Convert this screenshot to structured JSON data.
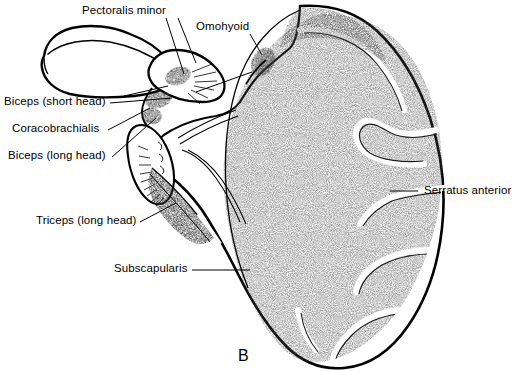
{
  "figure": {
    "letter": "B",
    "view": "anterior-costal-surface-right-scapula",
    "background_color": "#ffffff",
    "ink_color": "#000000",
    "stipple_color": "#5a5a5a"
  },
  "labels": [
    {
      "id": "pectoralis-minor",
      "text": "Pectoralis minor",
      "text_x": 82,
      "text_y": 4,
      "leader": [
        [
          178,
          18
        ],
        [
          196,
          63
        ]
      ]
    },
    {
      "id": "omohyoid",
      "text": "Omohyoid",
      "text_x": 196,
      "text_y": 20,
      "leader": [
        [
          250,
          34
        ],
        [
          262,
          55
        ]
      ]
    },
    {
      "id": "biceps-short-head",
      "text": "Biceps (short head)",
      "text_x": 4,
      "text_y": 95,
      "leader": [
        [
          110,
          103
        ],
        [
          172,
          98
        ]
      ]
    },
    {
      "id": "coracobrachialis",
      "text": "Coracobrachialis",
      "text_x": 12,
      "text_y": 122,
      "leader": [
        [
          108,
          130
        ],
        [
          150,
          108
        ]
      ]
    },
    {
      "id": "biceps-long-head",
      "text": "Biceps (long head)",
      "text_x": 8,
      "text_y": 149,
      "leader": [
        [
          112,
          157
        ],
        [
          156,
          118
        ]
      ]
    },
    {
      "id": "triceps-long-head",
      "text": "Triceps (long head)",
      "text_x": 36,
      "text_y": 214,
      "leader": [
        [
          140,
          222
        ],
        [
          176,
          203
        ]
      ]
    },
    {
      "id": "subscapularis",
      "text": "Subscapularis",
      "text_x": 114,
      "text_y": 262,
      "leader": [
        [
          192,
          270
        ],
        [
          250,
          270
        ]
      ]
    },
    {
      "id": "serratus-anterior",
      "text": "Serratus anterior",
      "text_x": 424,
      "text_y": 184,
      "leader": [
        [
          418,
          191
        ],
        [
          390,
          191
        ]
      ]
    }
  ]
}
